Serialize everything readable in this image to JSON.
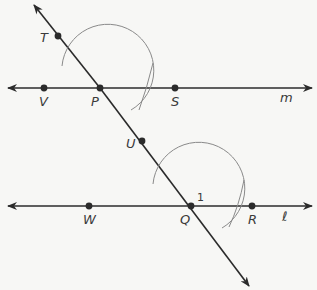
{
  "diagram": {
    "type": "geometry-construction",
    "colors": {
      "line": "#2b2b2b",
      "arc": "#8a8a8a",
      "label": "#3a3a3a",
      "background": "#f7f7f5"
    },
    "lines": [
      {
        "name": "m",
        "label": "m"
      },
      {
        "name": "l",
        "label": "ℓ"
      },
      {
        "name": "transversal",
        "label": ""
      }
    ],
    "points": {
      "T": "T",
      "V": "V",
      "P": "P",
      "S": "S",
      "U": "U",
      "W": "W",
      "Q": "Q",
      "R": "R"
    },
    "angle_label": "1"
  }
}
